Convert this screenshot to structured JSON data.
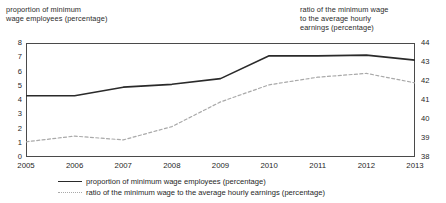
{
  "chart_data": {
    "type": "line",
    "title": "",
    "xlabel": "",
    "ylabel": "proportion of minimum wage employees (percentage)",
    "y2label": "ratio of the minimum wage to the average hourly earnings (percentage)",
    "categories": [
      "2005",
      "2006",
      "2007",
      "2008",
      "2009",
      "2010",
      "2011",
      "2012",
      "2013"
    ],
    "x": [
      2005,
      2006,
      2007,
      2008,
      2009,
      2010,
      2011,
      2012,
      2013
    ],
    "ylim": [
      0,
      8
    ],
    "y2lim": [
      38,
      44
    ],
    "yticks": [
      0,
      1,
      2,
      3,
      4,
      5,
      6,
      7,
      8
    ],
    "y2ticks": [
      38,
      39,
      40,
      41,
      42,
      43,
      44
    ],
    "grid": false,
    "legend_position": "bottom",
    "series": [
      {
        "name": "proportion of minimum wage employees (percentage)",
        "axis": "left",
        "style": "solid",
        "color": "#2a2a2a",
        "values": [
          4.3,
          4.3,
          4.9,
          5.1,
          5.5,
          7.1,
          7.1,
          7.15,
          6.8
        ]
      },
      {
        "name": "ratio of the minimum wage to the average hourly earnings (percentage)",
        "axis": "right",
        "style": "dotted",
        "color": "#a9a9a9",
        "values": [
          38.8,
          39.1,
          38.9,
          39.6,
          40.9,
          41.8,
          42.2,
          42.4,
          41.9
        ]
      }
    ]
  },
  "axis_titles": {
    "left": "proportion of minimum\nwage employees (percentage)",
    "right": "ratio of the minimum wage\nto the average hourly\nearnings (percentage)"
  },
  "legend": {
    "items": [
      {
        "label": "proportion of minimum wage employees (percentage)",
        "style": "solid"
      },
      {
        "label": "ratio of the minimum wage to the average hourly earnings (percentage)",
        "style": "dotted"
      }
    ]
  }
}
